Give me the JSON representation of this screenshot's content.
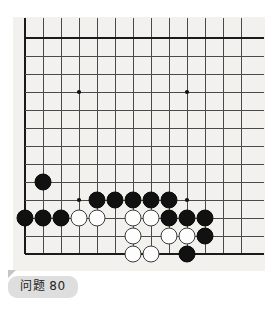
{
  "board": {
    "title": "go-board",
    "background_color": "#f2f1ee",
    "line_color": "#4a4a4a",
    "edge_color": "#1a1a1a",
    "star_point_color": "#111111",
    "columns": 13,
    "rows": 13,
    "cell_size": 18,
    "origin_x": 11,
    "origin_y": 20,
    "top_cropped": true,
    "crop_note": "vertical lines continue above the top horizontal line",
    "star_points": [
      {
        "col": 3,
        "row": 3
      },
      {
        "col": 9,
        "row": 3
      },
      {
        "col": 3,
        "row": 9
      },
      {
        "col": 9,
        "row": 9
      }
    ],
    "stones": [
      {
        "color": "black",
        "col": 1,
        "row": 8
      },
      {
        "color": "black",
        "col": 4,
        "row": 9
      },
      {
        "color": "black",
        "col": 5,
        "row": 9
      },
      {
        "color": "black",
        "col": 6,
        "row": 9
      },
      {
        "color": "black",
        "col": 7,
        "row": 9
      },
      {
        "color": "black",
        "col": 8,
        "row": 9
      },
      {
        "color": "black",
        "col": 0,
        "row": 10
      },
      {
        "color": "black",
        "col": 1,
        "row": 10
      },
      {
        "color": "black",
        "col": 2,
        "row": 10
      },
      {
        "color": "white",
        "col": 3,
        "row": 10
      },
      {
        "color": "white",
        "col": 4,
        "row": 10
      },
      {
        "color": "white",
        "col": 6,
        "row": 10
      },
      {
        "color": "white",
        "col": 7,
        "row": 10
      },
      {
        "color": "black",
        "col": 8,
        "row": 10
      },
      {
        "color": "black",
        "col": 9,
        "row": 10
      },
      {
        "color": "black",
        "col": 10,
        "row": 10
      },
      {
        "color": "white",
        "col": 6,
        "row": 11
      },
      {
        "color": "white",
        "col": 8,
        "row": 11
      },
      {
        "color": "white",
        "col": 9,
        "row": 11
      },
      {
        "color": "black",
        "col": 10,
        "row": 11
      },
      {
        "color": "white",
        "col": 6,
        "row": 12
      },
      {
        "color": "white",
        "col": 7,
        "row": 12
      },
      {
        "color": "black",
        "col": 9,
        "row": 12
      }
    ],
    "black_count": 14,
    "white_count": 9
  },
  "caption": {
    "label": "问题 80",
    "number": "80",
    "prefix": "问题",
    "background_color": "#dedede",
    "text_color": "#222222"
  }
}
